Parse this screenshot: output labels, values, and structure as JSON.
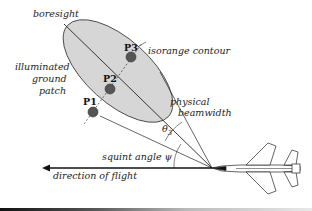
{
  "labels": {
    "boresight": "boresight",
    "isorange": "isorange contour",
    "illuminated_line1": "illuminated",
    "illuminated_line2": "ground",
    "illuminated_line3": "patch",
    "physical_line1": "physical",
    "physical_line2": "beamwidth",
    "theta": "θ",
    "theta_sub": "3",
    "squint": "squint angle ψ",
    "direction": "direction of flight"
  },
  "points": [
    {
      "id": "P1",
      "label": "P1"
    },
    {
      "id": "P2",
      "label": "P2"
    },
    {
      "id": "P3",
      "label": "P3"
    }
  ],
  "colors": {
    "ellipse_fill": "#d6d6d6",
    "point_fill": "#555555",
    "line": "#222222"
  }
}
